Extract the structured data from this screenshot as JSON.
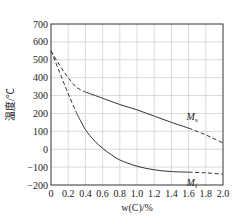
{
  "chart_data": {
    "type": "line",
    "title": "",
    "xlabel": "w(C)/%",
    "ylabel": "温度/℃",
    "xlim": [
      0,
      2.0
    ],
    "ylim": [
      -200,
      700
    ],
    "x_ticks": [
      "0",
      "0.2",
      "0.4",
      "0.6",
      "0.8",
      "1.0",
      "1.2",
      "1.4",
      "1.6",
      "1.8",
      "2.0"
    ],
    "x_tick_values": [
      0,
      0.2,
      0.4,
      0.6,
      0.8,
      1.0,
      1.2,
      1.4,
      1.6,
      1.8,
      2.0
    ],
    "y_ticks": [
      "700",
      "600",
      "500",
      "400",
      "300",
      "200",
      "100",
      "0",
      "−100",
      "−200"
    ],
    "y_tick_values": [
      700,
      600,
      500,
      400,
      300,
      200,
      100,
      0,
      -100,
      -200
    ],
    "grid": true,
    "series": [
      {
        "name": "Ms",
        "label_main": "M",
        "label_sub": "s",
        "segments": [
          {
            "style": "dashed",
            "x": [
              0,
              0.1,
              0.2,
              0.3,
              0.4
            ],
            "y": [
              550,
              470,
              400,
              345,
              320
            ]
          },
          {
            "style": "solid",
            "x": [
              0.4,
              0.6,
              0.8,
              1.0,
              1.2,
              1.4,
              1.6
            ],
            "y": [
              320,
              285,
              250,
              220,
              185,
              150,
              118
            ]
          },
          {
            "style": "dashed",
            "x": [
              1.6,
              1.8,
              2.0
            ],
            "y": [
              118,
              80,
              35
            ]
          }
        ]
      },
      {
        "name": "Mf",
        "label_main": "M",
        "label_sub": "f",
        "segments": [
          {
            "style": "dashed",
            "x": [
              0,
              0.1,
              0.2,
              0.3
            ],
            "y": [
              550,
              430,
              310,
              200
            ]
          },
          {
            "style": "solid",
            "x": [
              0.3,
              0.4,
              0.5,
              0.6,
              0.7,
              0.8,
              1.0,
              1.2,
              1.4,
              1.6
            ],
            "y": [
              200,
              110,
              50,
              5,
              -30,
              -60,
              -95,
              -115,
              -125,
              -128
            ]
          },
          {
            "style": "dashed",
            "x": [
              1.6,
              1.8,
              2.0
            ],
            "y": [
              -128,
              -132,
              -140
            ]
          }
        ]
      }
    ]
  }
}
